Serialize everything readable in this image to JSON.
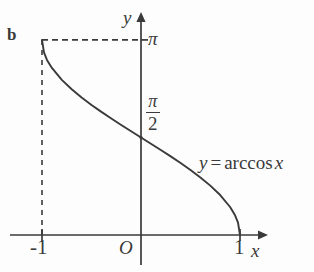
{
  "figure": {
    "panel_letter": "b",
    "background_color": "#fdfdfd",
    "ink_color": "#3a3a3a"
  },
  "axes": {
    "x_axis_label": "x",
    "y_axis_label": "y",
    "origin_label": "O",
    "x_ticks": [
      {
        "label": "-1",
        "value": -1
      },
      {
        "label": "1",
        "value": 1
      }
    ],
    "y_ticks": [
      {
        "label": "π",
        "value": 3.14159
      },
      {
        "label": "π/2",
        "numerator": "π",
        "denominator": "2",
        "value": 1.5708
      }
    ]
  },
  "curve": {
    "equation_y": "y",
    "equation_equals": "=",
    "equation_function": "arccos",
    "equation_variable": "x"
  },
  "chart_data": {
    "type": "line",
    "title": "",
    "subtitle": "",
    "xlabel": "x",
    "ylabel": "y",
    "xlim": [
      -1.35,
      1.35
    ],
    "ylim": [
      -0.45,
      3.6
    ],
    "grid": false,
    "legend": "none",
    "annotations": [
      {
        "text": "b",
        "role": "panel-letter"
      },
      {
        "text": "y = arccos x",
        "role": "curve-label"
      },
      {
        "text": "O",
        "role": "origin"
      }
    ],
    "xticks": [
      -1,
      1
    ],
    "xticklabels": [
      "-1",
      "1"
    ],
    "yticks": [
      1.5708,
      3.14159
    ],
    "yticklabels": [
      "π/2",
      "π"
    ],
    "dashed_guides": [
      {
        "type": "horizontal",
        "from": [
          -1,
          3.14159
        ],
        "to": [
          0,
          3.14159
        ]
      },
      {
        "type": "vertical",
        "from": [
          -1,
          0
        ],
        "to": [
          -1,
          3.14159
        ]
      }
    ],
    "series": [
      {
        "name": "y = arccos x",
        "x": [
          -1.0,
          -0.98,
          -0.95,
          -0.9,
          -0.8,
          -0.7,
          -0.6,
          -0.5,
          -0.4,
          -0.3,
          -0.2,
          -0.1,
          0.0,
          0.1,
          0.2,
          0.3,
          0.4,
          0.5,
          0.6,
          0.7,
          0.8,
          0.9,
          0.95,
          0.98,
          1.0
        ],
        "y": [
          3.1416,
          2.9416,
          2.8198,
          2.6906,
          2.4981,
          2.3462,
          2.2143,
          2.0944,
          1.9823,
          1.8755,
          1.7722,
          1.671,
          1.5708,
          1.4706,
          1.3694,
          1.2661,
          1.1593,
          1.0472,
          0.9273,
          0.7954,
          0.6435,
          0.451,
          0.3176,
          0.2003,
          0.0
        ]
      }
    ]
  }
}
